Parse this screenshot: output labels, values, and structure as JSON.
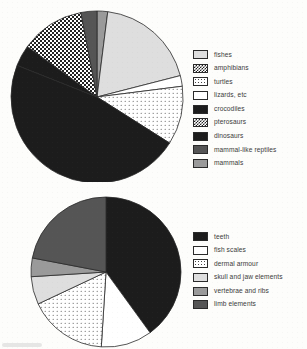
{
  "figure": {
    "background_color": "#fdfdfb",
    "text_color": "#3a3a3a",
    "outline_color": "#2a2a2a"
  },
  "chart_data": [
    {
      "type": "pie",
      "id": "tetrapod-taxa-pie",
      "title": "",
      "legend_position": "right",
      "start_angle_deg": 0,
      "direction": "clockwise",
      "center": {
        "x": 97,
        "y": 97
      },
      "radius": 86,
      "categories": [
        "mammals",
        "fishes",
        "turtles",
        "lizards, etc",
        "dinosaurs",
        "crocodiles",
        "pterosaurs",
        "mammal-like reptiles"
      ],
      "values": [
        2,
        19,
        2,
        11,
        47,
        4,
        12,
        3
      ],
      "slices": [
        {
          "label": "mammals",
          "percent": 2,
          "fill": "f-midgray",
          "swatch": "f-midgray"
        },
        {
          "label": "fishes",
          "percent": 19,
          "fill": "f-lightgray",
          "swatch": "f-lightgray"
        },
        {
          "label": "turtles",
          "percent": 2,
          "fill": "f-white",
          "swatch": "f-white"
        },
        {
          "label": "lizards, etc",
          "percent": 11,
          "fill": "f-dots",
          "swatch": "f-dots"
        },
        {
          "label": "dinosaurs",
          "percent": 47,
          "fill": "f-black",
          "swatch": "f-black"
        },
        {
          "label": "crocodiles",
          "percent": 4,
          "fill": "f-black",
          "swatch": "f-black"
        },
        {
          "label": "pterosaurs",
          "percent": 12,
          "fill": "f-checker",
          "swatch": "f-checker"
        },
        {
          "label": "mammal-like reptiles",
          "percent": 3,
          "fill": "f-darkgray",
          "swatch": "f-darkgray"
        }
      ],
      "legend": [
        {
          "label": "fishes",
          "swatch": "f-lightgray"
        },
        {
          "label": "amphibians",
          "swatch": "f-checker"
        },
        {
          "label": "turtles",
          "swatch": "f-dots"
        },
        {
          "label": "lizards, etc",
          "swatch": "f-white"
        },
        {
          "label": "crocodiles",
          "swatch": "f-black"
        },
        {
          "label": "pterosaurs",
          "swatch": "f-checker"
        },
        {
          "label": "dinosaurs",
          "swatch": "f-black"
        },
        {
          "label": "mammal-like reptiles",
          "swatch": "f-darkgray"
        },
        {
          "label": "mammals",
          "swatch": "f-midgray"
        }
      ]
    },
    {
      "type": "pie",
      "id": "skeletal-elements-pie",
      "title": "",
      "legend_position": "right",
      "start_angle_deg": 0,
      "direction": "clockwise",
      "center": {
        "x": 106,
        "y": 272
      },
      "radius": 75,
      "categories": [
        "teeth",
        "fish scales",
        "dermal armour",
        "skull and jaw elements",
        "vertebrae and ribs",
        "limb elements"
      ],
      "values": [
        40,
        11,
        17,
        6,
        4,
        22
      ],
      "slices": [
        {
          "label": "teeth",
          "percent": 40,
          "fill": "f-black",
          "swatch": "f-black"
        },
        {
          "label": "fish scales",
          "percent": 11,
          "fill": "f-white",
          "swatch": "f-white"
        },
        {
          "label": "dermal armour",
          "percent": 17,
          "fill": "f-dots",
          "swatch": "f-dots"
        },
        {
          "label": "skull and jaw elements",
          "percent": 6,
          "fill": "f-lightgray",
          "swatch": "f-lightgray"
        },
        {
          "label": "vertebrae and ribs",
          "percent": 4,
          "fill": "f-midgray",
          "swatch": "f-midgray"
        },
        {
          "label": "limb elements",
          "percent": 22,
          "fill": "f-darkgray",
          "swatch": "f-darkgray"
        }
      ],
      "legend": [
        {
          "label": "teeth",
          "swatch": "f-black"
        },
        {
          "label": "fish scales",
          "swatch": "f-white"
        },
        {
          "label": "dermal armour",
          "swatch": "f-dots"
        },
        {
          "label": "skull and jaw elements",
          "swatch": "f-lightgray"
        },
        {
          "label": "vertebrae and ribs",
          "swatch": "f-midgray"
        },
        {
          "label": "limb elements",
          "swatch": "f-darkgray"
        }
      ]
    }
  ]
}
